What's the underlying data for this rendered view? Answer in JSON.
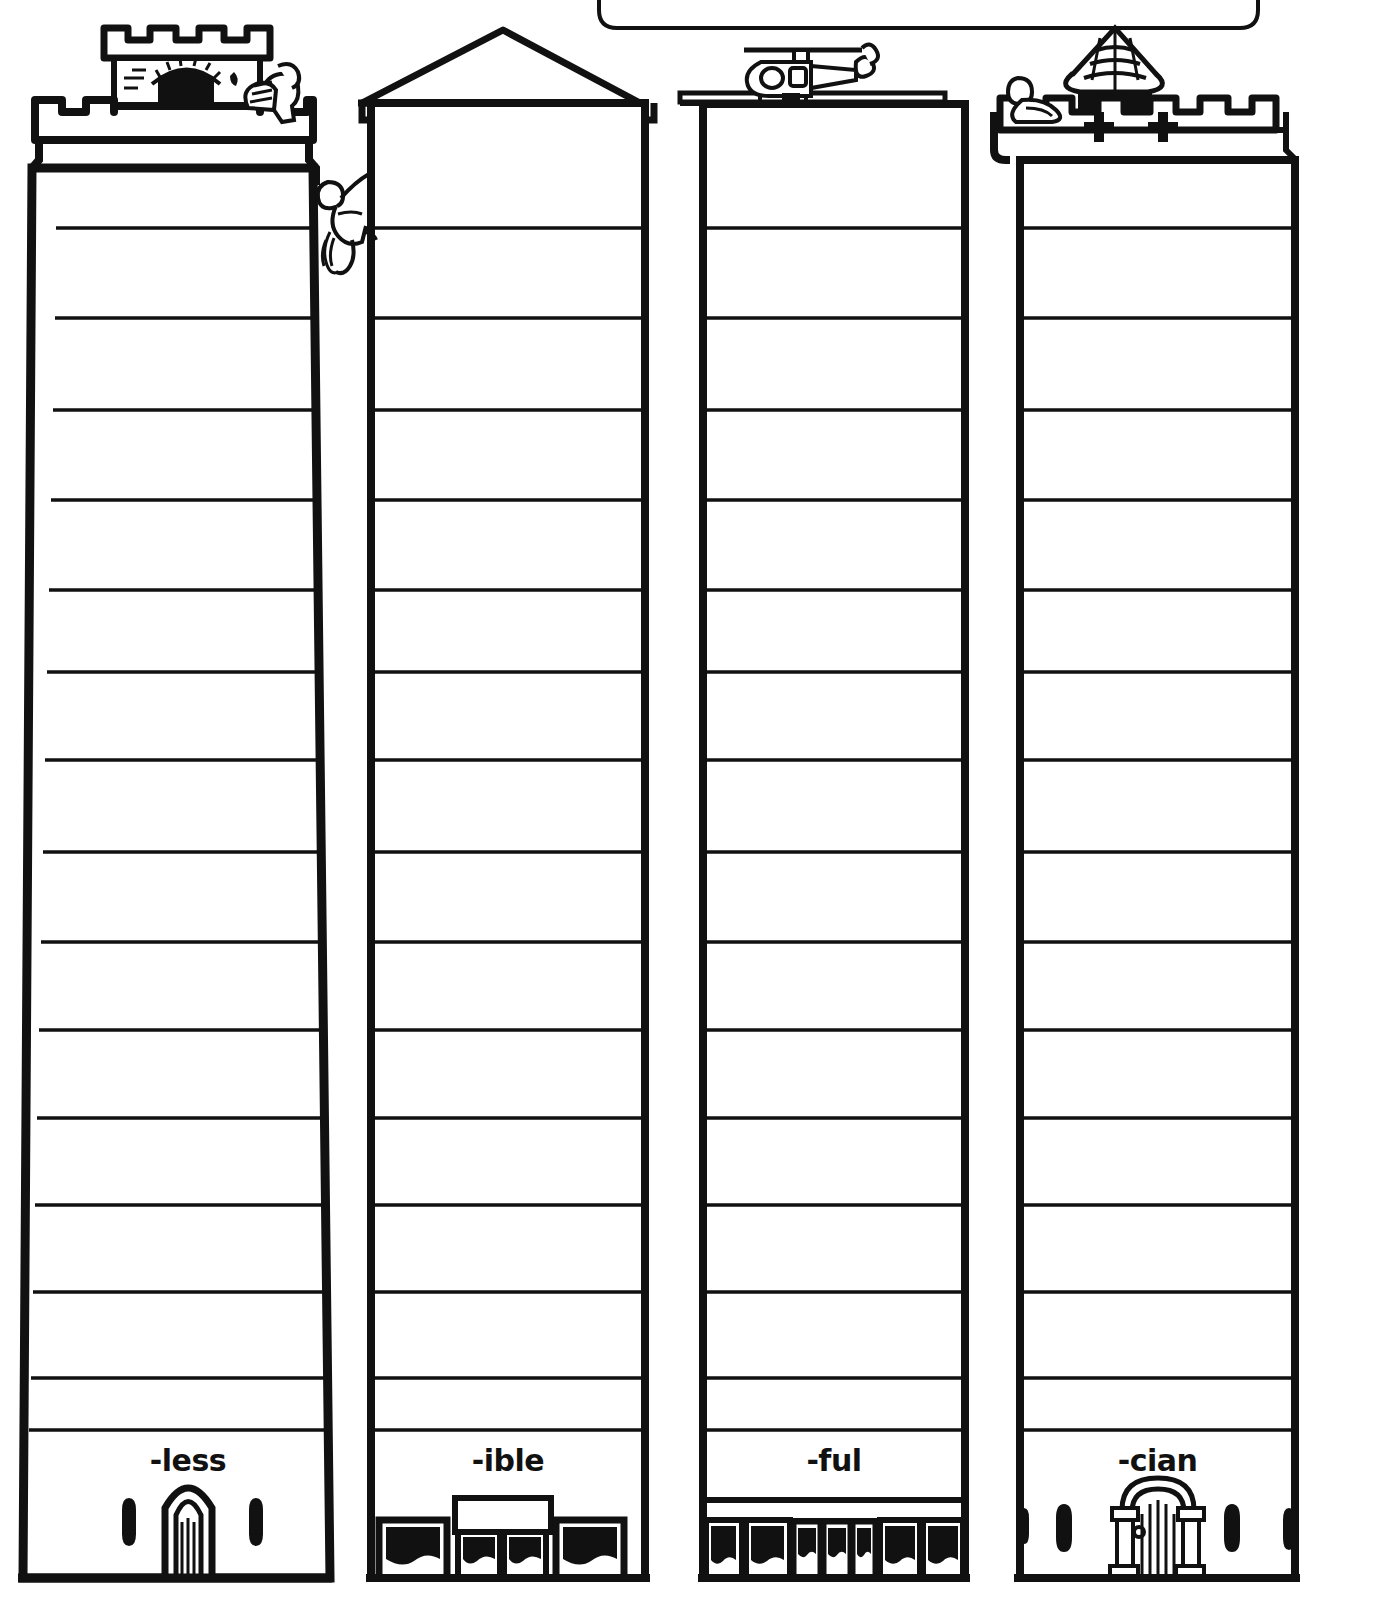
{
  "worksheet": {
    "type": "suffix-towers-worksheet",
    "description": "Four blank tall towers/skyscrapers with ruled floors, each labeled with a word suffix at the base",
    "background_color": "#ffffff",
    "ink_color": "#111111",
    "top_callout_box": {
      "label": "",
      "shape": "rounded-rectangle",
      "state": "empty"
    }
  },
  "towers": [
    {
      "id": "tower-less",
      "label": "-less",
      "top_ornament": "castle-turret-icon",
      "top_figure": "knight-figure-icon",
      "door_style": "gothic-arch-door-icon",
      "window_style": "arrow-slit-icon",
      "floors": 16,
      "shape": "tapered"
    },
    {
      "id": "tower-ible",
      "label": "-ible",
      "top_ornament": "pitched-roof-icon",
      "top_figure": "climber-figure-icon",
      "door_style": "shopfront-icon",
      "window_style": "shop-window-icon",
      "floors": 16,
      "shape": "straight"
    },
    {
      "id": "tower-ful",
      "label": "-ful",
      "top_ornament": "flat-roof-icon",
      "top_figure": "helicopter-icon",
      "door_style": "glass-storefront-icon",
      "window_style": "shop-window-icon",
      "floors": 16,
      "shape": "straight"
    },
    {
      "id": "tower-cian",
      "label": "-cian",
      "top_ornament": "conical-hut-roof-icon",
      "top_figure": "lookout-figure-icon",
      "door_style": "romanesque-arch-door-icon",
      "window_style": "arrow-slit-icon",
      "floors": 16,
      "shape": "straight"
    }
  ],
  "floor_lines": {
    "count_per_tower": 16,
    "y_positions": [
      228,
      318,
      410,
      500,
      590,
      672,
      760,
      852,
      942,
      1030,
      1118,
      1205,
      1292,
      1378,
      1430
    ],
    "ground_line_y": 1578
  }
}
